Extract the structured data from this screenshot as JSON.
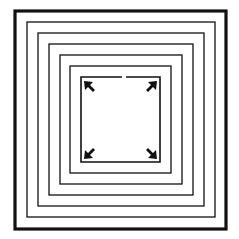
{
  "diagram": {
    "background": "#ffffff",
    "stroke_color": "#111111",
    "squares": [
      {
        "x": 15,
        "y": 11,
        "w": 211,
        "h": 218,
        "stroke": 3.2
      },
      {
        "x": 27,
        "y": 22,
        "w": 188,
        "h": 195,
        "stroke": 1.3
      },
      {
        "x": 38,
        "y": 33,
        "w": 166,
        "h": 173,
        "stroke": 1.3
      },
      {
        "x": 49,
        "y": 44,
        "w": 144,
        "h": 151,
        "stroke": 1.3
      },
      {
        "x": 60,
        "y": 55,
        "w": 122,
        "h": 129,
        "stroke": 1.3
      },
      {
        "x": 70,
        "y": 66,
        "w": 101,
        "h": 107,
        "stroke": 1.3
      },
      {
        "x": 81,
        "y": 77,
        "w": 79,
        "h": 85,
        "stroke": 1.6,
        "top_gap": [
          122,
          126
        ]
      }
    ],
    "corner_arrows": [
      {
        "corner": "top-left",
        "tip_x": 84,
        "tip_y": 81,
        "direction": "up-left"
      },
      {
        "corner": "top-right",
        "tip_x": 157,
        "tip_y": 81,
        "direction": "up-right"
      },
      {
        "corner": "bottom-left",
        "tip_x": 84,
        "tip_y": 159,
        "direction": "down-left"
      },
      {
        "corner": "bottom-right",
        "tip_x": 157,
        "tip_y": 159,
        "direction": "down-right"
      }
    ]
  }
}
